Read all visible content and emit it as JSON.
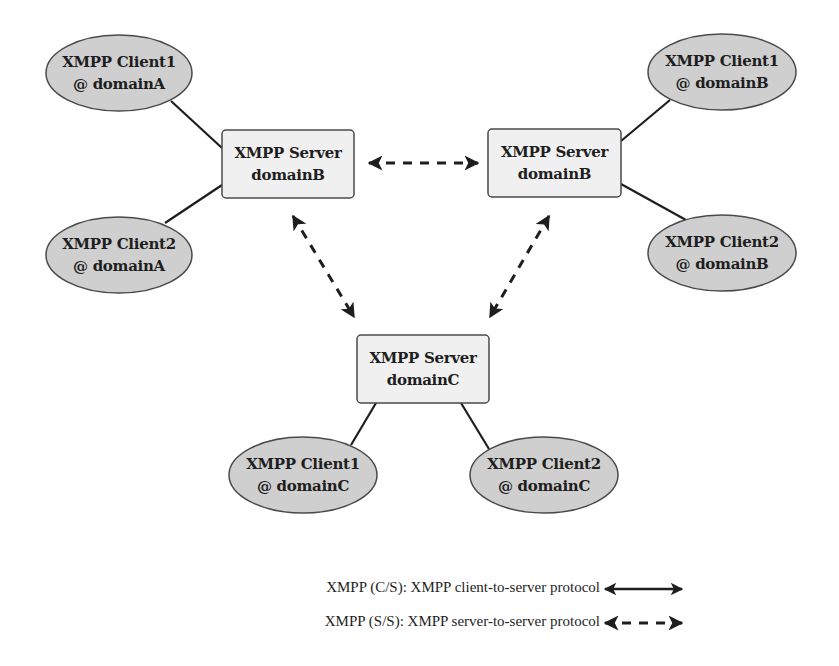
{
  "diagram": {
    "colors": {
      "client_fill": "#cfcfcf",
      "server_fill": "#f0f0f0",
      "stroke": "#1e1e1e",
      "background": "#ffffff"
    },
    "servers": [
      {
        "id": "server-left",
        "line1": "XMPP Server",
        "line2": "domainB"
      },
      {
        "id": "server-right",
        "line1": "XMPP Server",
        "line2": "domainB"
      },
      {
        "id": "server-bottom",
        "line1": "XMPP Server",
        "line2": "domainC"
      }
    ],
    "clients": [
      {
        "id": "client1-domainA",
        "line1": "XMPP Client1",
        "line2": "@ domainA"
      },
      {
        "id": "client2-domainA",
        "line1": "XMPP Client2",
        "line2": "@ domainA"
      },
      {
        "id": "client1-domainB",
        "line1": "XMPP Client1",
        "line2": "@ domainB"
      },
      {
        "id": "client2-domainB",
        "line1": "XMPP Client2",
        "line2": "@ domainB"
      },
      {
        "id": "client1-domainC",
        "line1": "XMPP Client1",
        "line2": "@ domainC"
      },
      {
        "id": "client2-domainC",
        "line1": "XMPP Client2",
        "line2": "@ domainC"
      }
    ],
    "edges": [
      {
        "from": "client1-domainA",
        "to": "server-left",
        "type": "C/S"
      },
      {
        "from": "client2-domainA",
        "to": "server-left",
        "type": "C/S"
      },
      {
        "from": "client1-domainB",
        "to": "server-right",
        "type": "C/S"
      },
      {
        "from": "client2-domainB",
        "to": "server-right",
        "type": "C/S"
      },
      {
        "from": "client1-domainC",
        "to": "server-bottom",
        "type": "C/S"
      },
      {
        "from": "client2-domainC",
        "to": "server-bottom",
        "type": "C/S"
      },
      {
        "from": "server-left",
        "to": "server-right",
        "type": "S/S"
      },
      {
        "from": "server-left",
        "to": "server-bottom",
        "type": "S/S"
      },
      {
        "from": "server-right",
        "to": "server-bottom",
        "type": "S/S"
      }
    ],
    "legend": [
      {
        "label": "XMPP (C/S): XMPP client-to-server protocol",
        "style": "solid"
      },
      {
        "label": "XMPP (S/S): XMPP server-to-server protocol",
        "style": "dashed"
      }
    ]
  }
}
